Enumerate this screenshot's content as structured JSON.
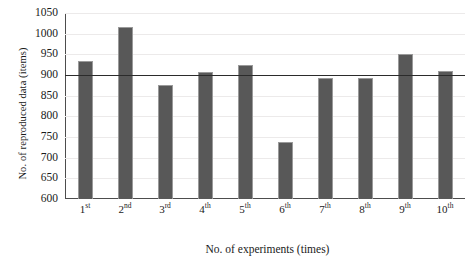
{
  "chart_data": {
    "type": "bar",
    "title": "",
    "xlabel": "No. of experiments (times)",
    "ylabel": "No. of reproduced data (items)",
    "categories": [
      "1st",
      "2nd",
      "3rd",
      "4th",
      "5th",
      "6th",
      "7th",
      "8th",
      "9th",
      "10th"
    ],
    "category_labels": [
      {
        "num": "1",
        "ord": "st"
      },
      {
        "num": "2",
        "ord": "nd"
      },
      {
        "num": "3",
        "ord": "rd"
      },
      {
        "num": "4",
        "ord": "th"
      },
      {
        "num": "5",
        "ord": "th"
      },
      {
        "num": "6",
        "ord": "th"
      },
      {
        "num": "7",
        "ord": "th"
      },
      {
        "num": "8",
        "ord": "th"
      },
      {
        "num": "9",
        "ord": "th"
      },
      {
        "num": "10",
        "ord": "th"
      }
    ],
    "values": [
      935,
      1016,
      877,
      908,
      925,
      737,
      893,
      893,
      951,
      910
    ],
    "ylim": [
      600,
      1050
    ],
    "ytick_step": 50,
    "yticks": [
      600,
      650,
      700,
      750,
      800,
      850,
      900,
      950,
      1000,
      1050
    ],
    "grid": true,
    "legend": "none",
    "reference_line": {
      "value": 900,
      "label": ""
    },
    "colors": {
      "bar_fill": "#585858",
      "bar_edge": "#9a9a9a",
      "reference_line": "#2b2b2b",
      "axis": "#4d4d4d",
      "gridline": "#eceaea",
      "text": "#1a1a1a",
      "background": "#ffffff"
    }
  }
}
